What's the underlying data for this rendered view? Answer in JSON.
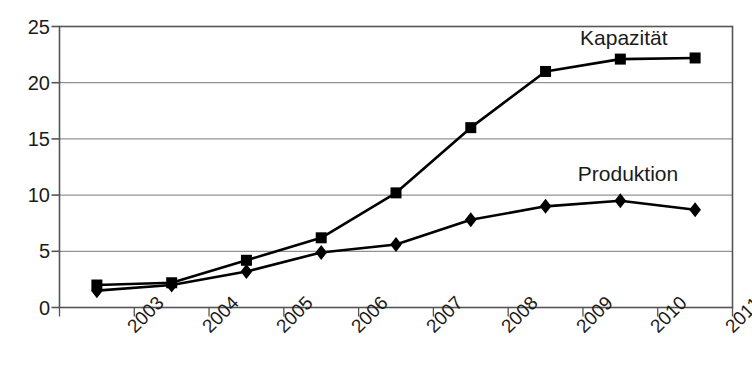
{
  "chart_data": {
    "type": "line",
    "title": "",
    "subtitle": "",
    "xlabel": "",
    "ylabel": "",
    "categories": [
      "2003",
      "2004",
      "2005",
      "2006",
      "2007",
      "2008",
      "2009",
      "2010",
      "2011"
    ],
    "ylim": [
      0,
      25
    ],
    "yticks": [
      0,
      5,
      10,
      15,
      20,
      25
    ],
    "ytick_labels": [
      "0",
      "5",
      "10",
      "15",
      "20",
      "25"
    ],
    "grid": "horizontal",
    "legend_position": "inline-annotations",
    "series": [
      {
        "name": "Kapazität",
        "marker": "square",
        "color": "#000000",
        "values": [
          2.0,
          2.2,
          4.2,
          6.2,
          10.2,
          16.0,
          21.0,
          22.1,
          22.2
        ]
      },
      {
        "name": "Produktion",
        "marker": "diamond",
        "color": "#000000",
        "values": [
          1.5,
          2.0,
          3.2,
          4.9,
          5.6,
          7.8,
          9.0,
          9.5,
          8.7
        ]
      }
    ],
    "annotations": [
      {
        "text": "Kapazität",
        "x": 7.05,
        "y": 23.9
      },
      {
        "text": "Produktion",
        "x": 7.1,
        "y": 11.8
      }
    ]
  },
  "axes": {
    "frame_color": "#555555",
    "grid_color": "#777777",
    "line_color": "#000000"
  }
}
